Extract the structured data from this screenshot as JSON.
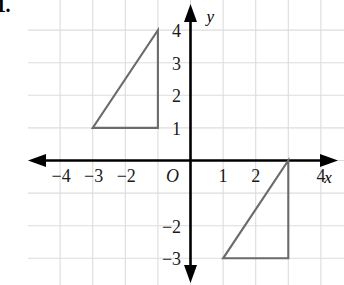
{
  "exercise": {
    "number": "1."
  },
  "chart_data": {
    "type": "scatter",
    "title": "",
    "xlabel": "x",
    "ylabel": "y",
    "xlim": [
      -4.8,
      4.7
    ],
    "ylim": [
      -4.0,
      4.5
    ],
    "grid": true,
    "grid_step": 1,
    "legend": "none",
    "x_tick_labels": [
      {
        "value": -4,
        "text": "−4"
      },
      {
        "value": -3,
        "text": "−3"
      },
      {
        "value": -2,
        "text": "−2"
      },
      {
        "value": 1,
        "text": "1"
      },
      {
        "value": 2,
        "text": "2"
      },
      {
        "value": 4,
        "text": "4"
      }
    ],
    "y_tick_labels": [
      {
        "value": 4,
        "text": "4"
      },
      {
        "value": 3,
        "text": "3"
      },
      {
        "value": 2,
        "text": "2"
      },
      {
        "value": 1,
        "text": "1"
      },
      {
        "value": -2,
        "text": "−2"
      },
      {
        "value": -3,
        "text": "−3"
      }
    ],
    "origin_label": "O",
    "series": [
      {
        "name": "upper-triangle",
        "type": "polygon",
        "closed": true,
        "color": "#6b6b6b",
        "points": [
          [
            -3,
            1
          ],
          [
            -1,
            1
          ],
          [
            -1,
            4
          ]
        ]
      },
      {
        "name": "lower-triangle",
        "type": "polygon",
        "closed": true,
        "color": "#6b6b6b",
        "points": [
          [
            1,
            -3
          ],
          [
            3,
            -3
          ],
          [
            3,
            0
          ]
        ]
      }
    ]
  },
  "style": {
    "grid_color": "#dcdcdc",
    "axis_color": "#000000",
    "shape_color": "#6b6b6b",
    "background": "#ffffff"
  }
}
